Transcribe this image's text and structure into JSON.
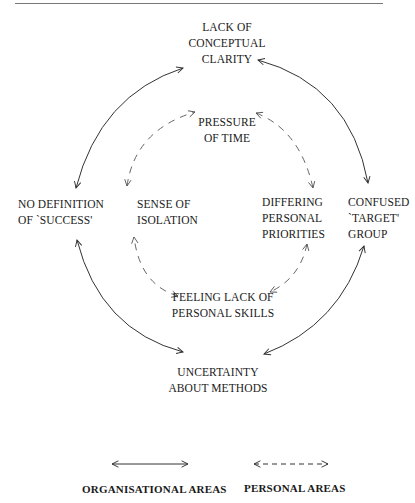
{
  "diagram": {
    "nodes": {
      "lack_of_conceptual_clarity": [
        "LACK OF",
        "CONCEPTUAL",
        "CLARITY"
      ],
      "pressure_of_time": [
        "PRESSURE",
        "OF TIME"
      ],
      "no_definition_of_success": [
        "NO DEFINITION",
        "OF `SUCCESS'"
      ],
      "sense_of_isolation": [
        "SENSE OF",
        "ISOLATION"
      ],
      "differing_personal_priorities": [
        "DIFFERING",
        "PERSONAL",
        "PRIORITIES"
      ],
      "confused_target_group": [
        "CONFUSED",
        "`TARGET'",
        "GROUP"
      ],
      "feeling_lack_of_personal_skills": [
        "FEELING LACK OF",
        "PERSONAL SKILLS"
      ],
      "uncertainty_about_methods": [
        "UNCERTAINTY",
        "ABOUT METHODS"
      ]
    },
    "outer_cycle": {
      "type": "organisational",
      "line_style": "solid",
      "links": [
        [
          "NO DEFINITION OF `SUCCESS'",
          "LACK OF CONCEPTUAL CLARITY"
        ],
        [
          "LACK OF CONCEPTUAL CLARITY",
          "CONFUSED `TARGET' GROUP"
        ],
        [
          "CONFUSED `TARGET' GROUP",
          "UNCERTAINTY ABOUT METHODS"
        ],
        [
          "UNCERTAINTY ABOUT METHODS",
          "NO DEFINITION OF `SUCCESS'"
        ]
      ]
    },
    "inner_cycle": {
      "type": "personal",
      "line_style": "dashed",
      "links": [
        [
          "SENSE OF ISOLATION",
          "PRESSURE OF TIME"
        ],
        [
          "PRESSURE OF TIME",
          "DIFFERING PERSONAL PRIORITIES"
        ],
        [
          "DIFFERING PERSONAL PRIORITIES",
          "FEELING LACK OF PERSONAL SKILLS"
        ],
        [
          "FEELING LACK OF PERSONAL SKILLS",
          "SENSE OF ISOLATION"
        ]
      ]
    },
    "legend": {
      "organisational": {
        "label": "ORGANISATIONAL AREAS",
        "line_style": "solid"
      },
      "personal": {
        "label": "PERSONAL AREAS",
        "line_style": "dashed"
      }
    },
    "colors": {
      "line": "#333333",
      "dashed_line": "#555555",
      "text": "#1a1a1a"
    }
  }
}
